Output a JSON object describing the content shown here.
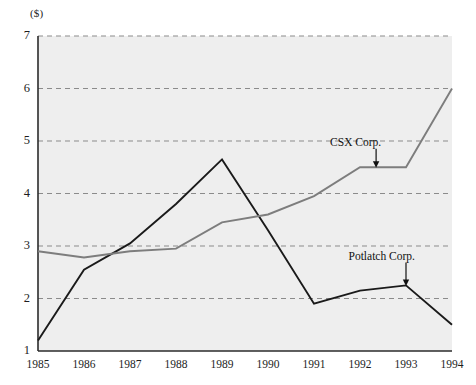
{
  "chart_data": {
    "type": "line",
    "title": "",
    "subtitle": "",
    "xlabel": "",
    "ylabel": "($)",
    "unit_label": "($)",
    "x": [
      1985,
      1986,
      1987,
      1988,
      1989,
      1990,
      1991,
      1992,
      1993,
      1994
    ],
    "xtick_labels": [
      "1985",
      "1986",
      "1987",
      "1988",
      "1989",
      "1990",
      "1991",
      "1992",
      "1993",
      "1994"
    ],
    "ytick_labels": [
      "1",
      "2",
      "3",
      "4",
      "5",
      "6",
      "7"
    ],
    "yticks": [
      1,
      2,
      3,
      4,
      5,
      6,
      7
    ],
    "xlim": [
      1985,
      1994
    ],
    "ylim": [
      1,
      7
    ],
    "grid": true,
    "grid_style": "dashed-horizontal",
    "legend": "annotations",
    "plot_background": "#eeeeee",
    "series": [
      {
        "name": "Potlatch Corp.",
        "color": "#1a1a1a",
        "values": [
          1.2,
          2.55,
          3.05,
          3.8,
          4.65,
          3.3,
          1.9,
          2.15,
          2.25,
          1.5
        ]
      },
      {
        "name": "CSX Corp.",
        "color": "#7d7d7d",
        "values": [
          2.9,
          2.78,
          2.9,
          2.95,
          3.45,
          3.6,
          3.95,
          4.5,
          4.5,
          6.0
        ]
      }
    ],
    "annotations": [
      {
        "text": "CSX Corp.",
        "target_x": 1992.35,
        "target_y": 4.5,
        "label_x": 1991.35,
        "label_y": 4.95,
        "arrow": "down"
      },
      {
        "text": "Potlatch Corp.",
        "target_x": 1993.0,
        "target_y": 2.25,
        "label_x": 1991.75,
        "label_y": 2.78,
        "arrow": "down"
      }
    ]
  }
}
